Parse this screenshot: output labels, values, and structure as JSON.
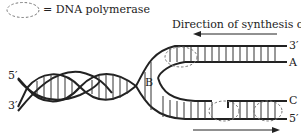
{
  "legend": {
    "symbol": "dashed-ellipse",
    "label": "= DNA polymerase"
  },
  "title_arrow": {
    "label": "Direction of synthesis of A"
  },
  "strand_labels": {
    "left_top": "5′",
    "left_bottom": "3′",
    "fork": "B",
    "right_top": "3′",
    "right_a": "A",
    "right_c": "C",
    "right_bottom": "5′"
  },
  "colors": {
    "line": "#222222",
    "dashed": "#777777"
  }
}
